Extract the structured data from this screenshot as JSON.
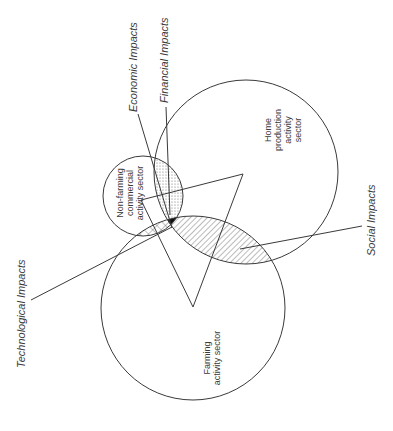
{
  "diagram": {
    "sectors": [
      {
        "id": "home",
        "lines": [
          "Home",
          "production",
          "activity",
          "sector"
        ],
        "cx": 246,
        "cy": 172,
        "r": 92
      },
      {
        "id": "non-farming",
        "lines": [
          "Non-farming",
          "commercial",
          "activity sector"
        ],
        "cx": 143,
        "cy": 196,
        "r": 40
      },
      {
        "id": "farming",
        "lines": [
          "Farming",
          "activity sector"
        ],
        "cx": 193,
        "cy": 308,
        "r": 92
      }
    ],
    "impacts": {
      "economic": "Economic Impacts",
      "financial": "Financial Impacts",
      "technological": "Technological Impacts",
      "social": "Social Impacts"
    },
    "colors": {
      "line": "#3a3a3a",
      "background": "#ffffff",
      "center_fill": "#111111"
    }
  }
}
